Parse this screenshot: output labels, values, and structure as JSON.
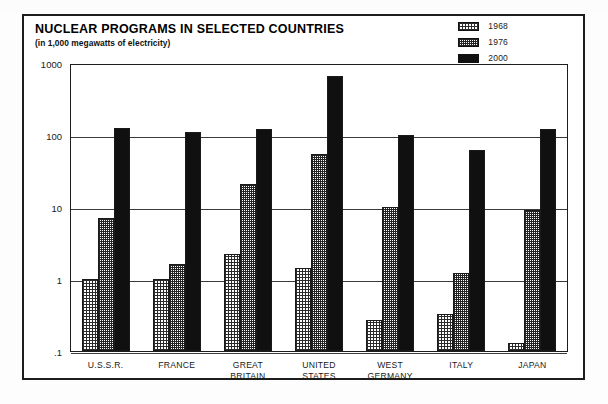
{
  "figure": {
    "title": "NUCLEAR PROGRAMS IN SELECTED COUNTRIES",
    "subtitle": "(in 1,000 megawatts of electricity)"
  },
  "legend": {
    "items": [
      {
        "label": "1968",
        "swatch": "light-checker-swatch"
      },
      {
        "label": "1976",
        "swatch": "medium-checker-swatch"
      },
      {
        "label": "2000",
        "swatch": "solid-black-swatch"
      }
    ]
  },
  "axis": {
    "y_ticks": [
      "1000",
      "100",
      "10",
      "1",
      ".1"
    ]
  },
  "chart_data": {
    "type": "bar",
    "title": "NUCLEAR PROGRAMS IN SELECTED COUNTRIES",
    "subtitle": "(in 1,000 megawatts of electricity)",
    "xlabel": "",
    "ylabel": "",
    "yscale": "log",
    "ylim": [
      0.1,
      1000
    ],
    "ytick_labels": [
      "1000",
      "100",
      "10",
      "1",
      ".1"
    ],
    "ytick_values": [
      1000,
      100,
      10,
      1,
      0.1
    ],
    "grid": true,
    "legend_position": "top-right",
    "categories": [
      "U.S.S.R.",
      "FRANCE",
      "GREAT BRITAIN",
      "UNITED STATES",
      "WEST GERMANY",
      "ITALY",
      "JAPAN"
    ],
    "category_lines": [
      [
        "U.S.S.R."
      ],
      [
        "FRANCE"
      ],
      [
        "GREAT",
        "BRITAIN"
      ],
      [
        "UNITED",
        "STATES"
      ],
      [
        "WEST",
        "GERMANY"
      ],
      [
        "ITALY"
      ],
      [
        "JAPAN"
      ]
    ],
    "series": [
      {
        "name": "1968",
        "values": [
          1.0,
          1.0,
          2.2,
          1.4,
          0.27,
          0.33,
          0.13
        ]
      },
      {
        "name": "1976",
        "values": [
          7.0,
          1.6,
          21.0,
          54.0,
          10.0,
          1.2,
          9.0
        ]
      },
      {
        "name": "2000",
        "values": [
          125.0,
          110.0,
          120.0,
          650.0,
          100.0,
          62.0,
          122.0
        ]
      }
    ]
  }
}
